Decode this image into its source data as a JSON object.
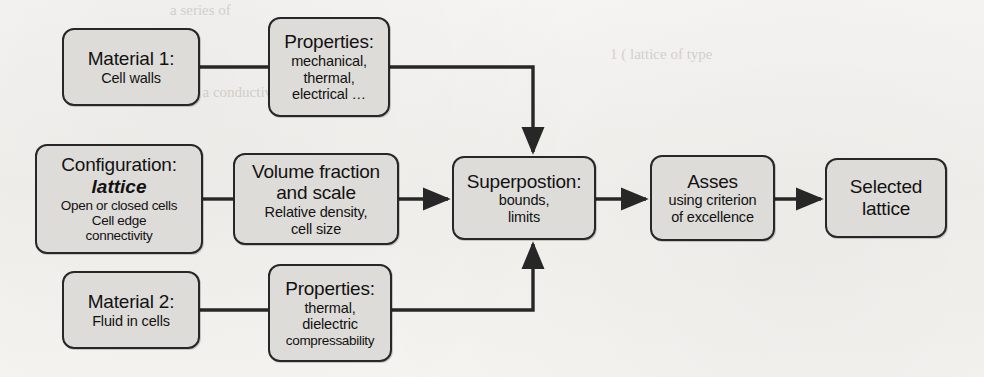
{
  "diagram": {
    "type": "flowchart",
    "nodes": {
      "material_1": {
        "title": "Material 1:",
        "sub_1": "Cell walls"
      },
      "properties_1": {
        "title": "Properties:",
        "sub_1": "mechanical,",
        "sub_2": "thermal,",
        "sub_3": "electrical …"
      },
      "configuration": {
        "title": "Configuration:",
        "emphasis": "lattice",
        "sub_1": "Open or closed cells",
        "sub_2": "Cell edge",
        "sub_3": "connectivity"
      },
      "volume_fraction": {
        "title_line_1": "Volume fraction",
        "title_line_2": "and scale",
        "sub_1": "Relative density,",
        "sub_2": "cell size"
      },
      "superposition": {
        "title": "Superpostion:",
        "sub_1": "bounds,",
        "sub_2": "limits"
      },
      "asses": {
        "title": "Asses",
        "sub_1": "using criterion",
        "sub_2": "of excellence"
      },
      "selected": {
        "title_line_1": "Selected",
        "title_line_2": "lattice"
      },
      "material_2": {
        "title": "Material 2:",
        "sub_1": "Fluid in cells"
      },
      "properties_2": {
        "title": "Properties:",
        "sub_1": "thermal,",
        "sub_2": "dielectric",
        "sub_3": "compressability"
      }
    },
    "connectors": [
      {
        "name": "material-1-to-properties-1",
        "style": "plain-line",
        "arrow": false
      },
      {
        "name": "properties-1-to-superposition",
        "style": "elbow-down",
        "arrow": true
      },
      {
        "name": "configuration-to-volume-fraction",
        "style": "plain-line",
        "arrow": false
      },
      {
        "name": "volume-fraction-to-superposition",
        "style": "straight",
        "arrow": true
      },
      {
        "name": "superposition-to-asses",
        "style": "straight",
        "arrow": true
      },
      {
        "name": "asses-to-selected",
        "style": "straight",
        "arrow": true
      },
      {
        "name": "material-2-to-properties-2",
        "style": "plain-line",
        "arrow": false
      },
      {
        "name": "properties-2-to-superposition",
        "style": "elbow-up",
        "arrow": true
      }
    ],
    "colors": {
      "node_fill": "#dedcd9",
      "node_border": "#272727",
      "connector": "#272727",
      "page_background": "#f4f3f1",
      "text": "#121212"
    }
  },
  "background_artifacts": {
    "note": "faint bleed-through text from reverse of scanned page",
    "ghosts": [
      "a series of",
      "shell with a conductivity low but can b",
      "1 (   lattice of type",
      "Lattices"
    ]
  }
}
